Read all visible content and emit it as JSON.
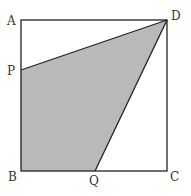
{
  "diagram": {
    "type": "geometry-square",
    "colors": {
      "line": "#222222",
      "shade": "#b9b9b9",
      "background": "#ffffff"
    },
    "points": {
      "A": {
        "label": "A",
        "x": 21,
        "y": 20
      },
      "B": {
        "label": "B",
        "x": 21,
        "y": 171
      },
      "C": {
        "label": "C",
        "x": 167,
        "y": 171
      },
      "D": {
        "label": "D",
        "x": 167,
        "y": 20
      },
      "P": {
        "label": "P",
        "x": 21,
        "y": 70
      },
      "Q": {
        "label": "Q",
        "x": 95,
        "y": 171
      }
    },
    "shaded_region": [
      "P",
      "B",
      "Q",
      "D"
    ]
  }
}
